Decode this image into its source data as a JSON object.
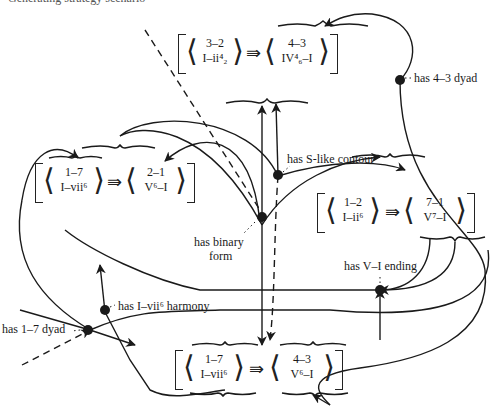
{
  "figure": {
    "truncated_caption": "Generating strategy scenario"
  },
  "nodes": [
    {
      "id": "top",
      "left": {
        "top": "3–2",
        "bottom": "I–ii⁴₂"
      },
      "right": {
        "top": "4–3",
        "bottom": "IV⁴₆–I"
      },
      "implies": "⇛"
    },
    {
      "id": "left",
      "left": {
        "top": "1–7",
        "bottom": "I–vii⁶"
      },
      "right": {
        "top": "2–1",
        "bottom": "V⁶–I"
      },
      "implies": "⇛"
    },
    {
      "id": "right",
      "left": {
        "top": "1–2",
        "bottom": "I–ii⁶"
      },
      "right": {
        "top": "7–1",
        "bottom": "V⁷–I"
      },
      "implies": "⇛"
    },
    {
      "id": "bottom",
      "left": {
        "top": "1–7",
        "bottom": "I–vii⁶"
      },
      "right": {
        "top": "4–3",
        "bottom": "V⁶–I"
      },
      "implies": "⇛"
    }
  ],
  "features": [
    {
      "id": "s_contour",
      "label": "has S-like contour"
    },
    {
      "id": "four_three",
      "label": "has 4–3 dyad"
    },
    {
      "id": "binary_form",
      "label": "has binary form",
      "line1": "has binary",
      "line2": "form"
    },
    {
      "id": "v_i",
      "label": "has V–I ending"
    },
    {
      "id": "i_vii6",
      "label": "has I–vii⁶ harmony"
    },
    {
      "id": "one_seven",
      "label": "has 1–7 dyad"
    }
  ],
  "colors": {
    "ink": "#1a1a1a",
    "background": "#ffffff"
  }
}
